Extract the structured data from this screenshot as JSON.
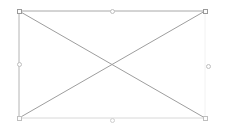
{
  "canvas": {
    "width": 225,
    "height": 136,
    "background_color": "#ffffff",
    "label": "image-placeholder-canvas"
  },
  "selection": {
    "name": "selection-bounding-box",
    "x": 19,
    "y": 11,
    "width": 186,
    "height": 107,
    "right": 205,
    "bottom": 118,
    "center_x": 112,
    "center_y": 64.5,
    "stroke_color": "#a8a8a8",
    "stroke_color_faint": "#c9c9c9",
    "stroke_color_faintest": "#dedede",
    "stroke_width": 1,
    "diagonal_color": "#9e9e9e",
    "diagonals": [
      {
        "name": "diagonal-top-left-to-bottom-right",
        "x1": 19,
        "y1": 11,
        "x2": 205,
        "y2": 118
      },
      {
        "name": "diagonal-top-right-to-bottom-left",
        "x1": 205,
        "y1": 11,
        "x2": 19,
        "y2": 118
      }
    ],
    "edges": [
      {
        "name": "edge-top",
        "x1": 19,
        "y1": 11,
        "x2": 205,
        "y2": 11,
        "color": "#a8a8a8"
      },
      {
        "name": "edge-left",
        "x1": 19,
        "y1": 11,
        "x2": 19,
        "y2": 118,
        "color": "#b4b4b4"
      },
      {
        "name": "edge-bottom",
        "x1": 19,
        "y1": 118,
        "x2": 205,
        "y2": 118,
        "color": "#d8d8d8"
      },
      {
        "name": "edge-right",
        "x1": 205,
        "y1": 11,
        "x2": 205,
        "y2": 118,
        "color": "#f2f2f2"
      }
    ],
    "handles": [
      {
        "name": "resize-handle-top-left",
        "shape": "square",
        "cx": 19,
        "cy": 11,
        "tone": "normal"
      },
      {
        "name": "resize-handle-top-center",
        "shape": "circle",
        "cx": 112,
        "cy": 11,
        "tone": "faint"
      },
      {
        "name": "resize-handle-top-right",
        "shape": "square",
        "cx": 205,
        "cy": 11,
        "tone": "normal"
      },
      {
        "name": "resize-handle-middle-left",
        "shape": "circle",
        "cx": 19,
        "cy": 64.5,
        "tone": "faint"
      },
      {
        "name": "resize-handle-middle-right",
        "shape": "circle",
        "cx": 208,
        "cy": 66,
        "tone": "faint"
      },
      {
        "name": "resize-handle-bottom-left",
        "shape": "square",
        "cx": 19,
        "cy": 118,
        "tone": "faint"
      },
      {
        "name": "resize-handle-bottom-center",
        "shape": "circle",
        "cx": 112,
        "cy": 120,
        "tone": "faintest"
      },
      {
        "name": "resize-handle-bottom-right",
        "shape": "square",
        "cx": 205,
        "cy": 118,
        "tone": "faint"
      }
    ]
  }
}
